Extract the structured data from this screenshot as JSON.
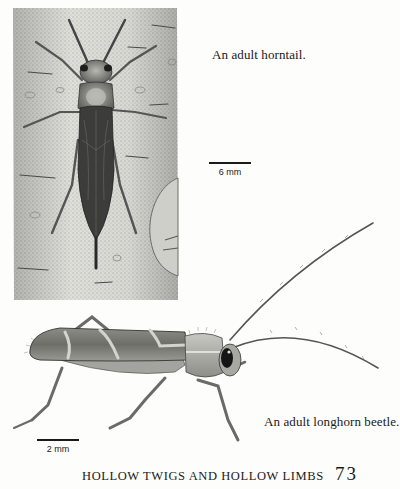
{
  "figures": [
    {
      "id": "horntail",
      "illustration": "horntail-on-bark-illustration",
      "caption": "An adult horntail.",
      "scale_bar": {
        "label": "6 mm"
      }
    },
    {
      "id": "longhorn",
      "illustration": "longhorn-beetle-illustration",
      "caption": "An adult longhorn beetle.",
      "scale_bar": {
        "label": "2 mm"
      }
    }
  ],
  "footer": {
    "running_head": "HOLLOW TWIGS AND HOLLOW LIMBS",
    "page_number": "73"
  },
  "colors": {
    "paper": "#fdfdfb",
    "ink": "#1a1a1a",
    "bark": "#d9d9d4",
    "insect_dark": "#3a3a3a"
  }
}
